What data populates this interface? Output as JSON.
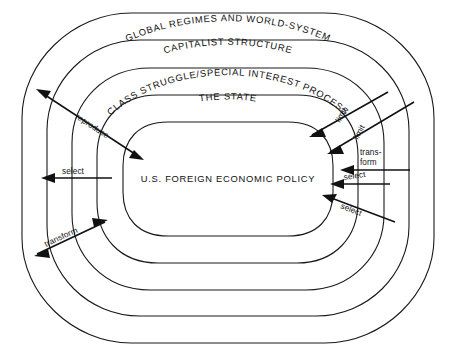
{
  "diagram": {
    "stroke_color": "#1a1a1a",
    "background_color": "#ffffff",
    "levels": [
      {
        "id": "global-regimes",
        "label": "GLOBAL REGIMES AND WORLD-SYSTEM",
        "order": 1
      },
      {
        "id": "capitalist-structure",
        "label": "CAPITALIST STRUCTURE",
        "order": 2
      },
      {
        "id": "class-struggle",
        "label": "CLASS STRUGGLE/SPECIAL INTEREST PROCESS",
        "order": 3
      },
      {
        "id": "the-state",
        "label": "THE STATE",
        "order": 4
      },
      {
        "id": "policy-core",
        "label": "U.S. FOREIGN ECONOMIC POLICY",
        "order": 5
      }
    ],
    "center": {
      "label": "U.S. FOREIGN ECONOMIC POLICY"
    },
    "arrows": [
      {
        "id": "reproduce",
        "label": "reproduce",
        "side": "left",
        "direction": "bidirectional-diagonal-up-left"
      },
      {
        "id": "select-left",
        "label": "select",
        "side": "left",
        "direction": "left"
      },
      {
        "id": "transform-left",
        "label": "transform",
        "side": "left",
        "direction": "bidirectional-diagonal-down-left"
      },
      {
        "id": "limit-outer",
        "label": "limit",
        "side": "right",
        "direction": "diagonal-down-left"
      },
      {
        "id": "limit-inner",
        "label": "limit",
        "side": "right",
        "direction": "diagonal-down-left"
      },
      {
        "id": "transform-right",
        "label_line1": "trans-",
        "label_line2": "form",
        "label": "trans-form",
        "side": "right",
        "direction": "left"
      },
      {
        "id": "select-right-1",
        "label": "select",
        "side": "right",
        "direction": "left"
      },
      {
        "id": "select-right-2",
        "label": "select",
        "side": "right",
        "direction": "diagonal-up-left"
      }
    ]
  }
}
